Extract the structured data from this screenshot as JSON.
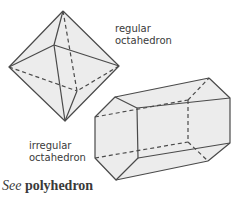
{
  "labels": {
    "regular": [
      "regular",
      "octahedron"
    ],
    "irregular": [
      "irregular",
      "octahedron"
    ]
  },
  "footer": {
    "see_prefix": "See",
    "see_term": "polyhedron"
  },
  "colors": {
    "stroke": "#4a4a4a",
    "face_fill": "#ececec",
    "text": "#3a3a3a"
  }
}
